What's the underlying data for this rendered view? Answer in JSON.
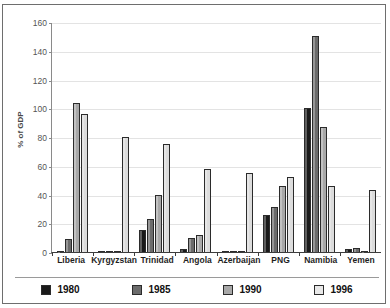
{
  "chart_data": {
    "type": "bar",
    "title": "",
    "xlabel": "",
    "ylabel": "% of GDP",
    "ylim": [
      0,
      160
    ],
    "yticks": [
      0,
      20,
      40,
      60,
      80,
      100,
      120,
      140,
      160
    ],
    "grid": true,
    "legend_position": "bottom",
    "categories": [
      "Liberia",
      "Kyrgyzstan",
      "Trinidad",
      "Angola",
      "Azerbaijan",
      "PNG",
      "Namibia",
      "Yemen"
    ],
    "series": [
      {
        "name": "1980",
        "color": "#1a1a1a",
        "values": [
          1,
          0,
          15,
          2,
          0,
          26,
          100,
          2
        ]
      },
      {
        "name": "1985",
        "color": "#6b6b6b",
        "values": [
          9,
          0,
          23,
          10,
          0,
          31,
          150,
          3
        ]
      },
      {
        "name": "1990",
        "color": "#a8a8a8",
        "values": [
          104,
          0,
          40,
          12,
          0,
          46,
          87,
          1
        ]
      },
      {
        "name": "1996",
        "color": "#dcdcdc",
        "values": [
          96,
          80,
          75,
          58,
          55,
          52,
          46,
          43
        ]
      }
    ]
  },
  "axis": {
    "y_title": "% of GDP",
    "y_tick_labels": [
      "160",
      "140",
      "120",
      "100",
      "80",
      "60",
      "40",
      "20",
      "0"
    ],
    "x_tick_labels": [
      "Liberia",
      "Kyrgyzstan",
      "Trinidad",
      "Angola",
      "Azerbaijan",
      "PNG",
      "Namibia",
      "Yemen"
    ]
  },
  "legend": {
    "entries": [
      {
        "label": "1980",
        "swatch": "#1a1a1a"
      },
      {
        "label": "1985",
        "swatch": "#6b6b6b"
      },
      {
        "label": "1990",
        "swatch": "#a8a8a8"
      },
      {
        "label": "1996",
        "swatch": "#e8e8e8"
      }
    ]
  }
}
